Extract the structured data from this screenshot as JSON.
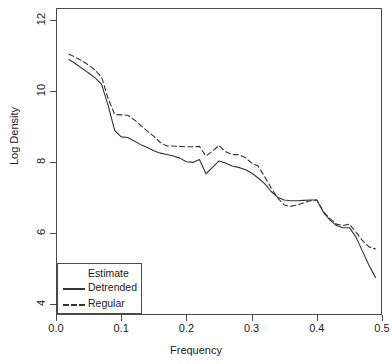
{
  "chart_data": {
    "type": "line",
    "title": "",
    "xlabel": "Frequency",
    "ylabel": "Log Density",
    "xlim": [
      0.0,
      0.5
    ],
    "ylim": [
      3.7,
      12.35
    ],
    "grid": false,
    "legend": {
      "title": "Estimate",
      "position": "bottom-left",
      "entries": [
        {
          "name": "Detrended",
          "style": "solid"
        },
        {
          "name": "Regular",
          "style": "dashed"
        }
      ]
    },
    "xticks": [
      {
        "value": 0.0,
        "label": "0.0"
      },
      {
        "value": 0.1,
        "label": "0.1"
      },
      {
        "value": 0.2,
        "label": "0.2"
      },
      {
        "value": 0.3,
        "label": "0.3"
      },
      {
        "value": 0.4,
        "label": "0.4"
      },
      {
        "value": 0.5,
        "label": "0.5"
      }
    ],
    "yticks": [
      {
        "value": 4,
        "label": "4"
      },
      {
        "value": 6,
        "label": "6"
      },
      {
        "value": 8,
        "label": "8"
      },
      {
        "value": 10,
        "label": "10"
      },
      {
        "value": 12,
        "label": "12"
      }
    ],
    "x": [
      0.02,
      0.03,
      0.04,
      0.05,
      0.06,
      0.07,
      0.08,
      0.09,
      0.1,
      0.11,
      0.12,
      0.13,
      0.14,
      0.15,
      0.16,
      0.17,
      0.18,
      0.19,
      0.2,
      0.21,
      0.22,
      0.23,
      0.24,
      0.25,
      0.26,
      0.27,
      0.28,
      0.29,
      0.3,
      0.31,
      0.32,
      0.33,
      0.34,
      0.35,
      0.36,
      0.37,
      0.38,
      0.39,
      0.4,
      0.41,
      0.42,
      0.43,
      0.44,
      0.45,
      0.46,
      0.47,
      0.48,
      0.49
    ],
    "series": [
      {
        "name": "Detrended",
        "style": "solid",
        "values": [
          10.9,
          10.78,
          10.65,
          10.52,
          10.38,
          10.2,
          9.6,
          8.9,
          8.72,
          8.7,
          8.6,
          8.5,
          8.42,
          8.33,
          8.26,
          8.22,
          8.18,
          8.12,
          8.02,
          8.0,
          8.08,
          7.68,
          7.86,
          8.04,
          7.98,
          7.9,
          7.86,
          7.8,
          7.7,
          7.56,
          7.4,
          7.18,
          7.02,
          6.94,
          6.92,
          6.92,
          6.93,
          6.94,
          6.94,
          6.6,
          6.38,
          6.22,
          6.16,
          6.16,
          5.9,
          5.5,
          5.1,
          4.76
        ]
      },
      {
        "name": "Regular",
        "style": "dashed",
        "values": [
          11.05,
          10.96,
          10.86,
          10.74,
          10.6,
          10.4,
          9.8,
          9.35,
          9.34,
          9.33,
          9.2,
          9.04,
          8.88,
          8.74,
          8.56,
          8.46,
          8.46,
          8.45,
          8.44,
          8.44,
          8.45,
          8.18,
          8.32,
          8.48,
          8.3,
          8.22,
          8.22,
          8.14,
          7.98,
          7.9,
          7.6,
          7.28,
          7.0,
          6.8,
          6.76,
          6.8,
          6.86,
          6.92,
          6.94,
          6.62,
          6.42,
          6.26,
          6.22,
          6.26,
          6.04,
          5.8,
          5.62,
          5.56
        ]
      }
    ]
  },
  "style": {
    "axis_color": "#4a4a4a",
    "series_color": "#333333",
    "background": "#ffffff"
  }
}
